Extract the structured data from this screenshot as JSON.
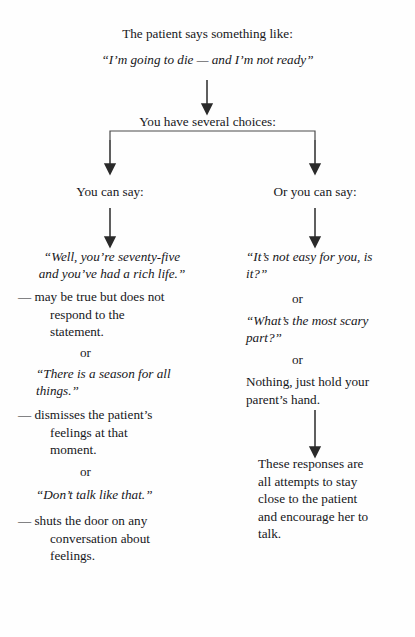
{
  "document": {
    "type": "flowchart",
    "title_line": "The patient says something like:",
    "patient_quote": "“I’m going to die — and I’m not ready”",
    "branch_prompt": "You have several choices:",
    "connector_or": "or"
  },
  "left_branch": {
    "heading": "You can say:",
    "options": [
      {
        "quote_lines": [
          "“Well, you’re seventy-five",
          "and you’ve had a rich life.”"
        ],
        "comment_first": "— may be true but does not",
        "comment_rest": [
          "respond to the",
          "statement."
        ]
      },
      {
        "quote_lines": [
          "“There is a season for all",
          "things.”"
        ],
        "comment_first": "— dismisses the patient’s",
        "comment_rest": [
          "feelings at that",
          "moment."
        ]
      },
      {
        "quote_lines": [
          "“Don’t talk like that.”"
        ],
        "comment_first": "— shuts the door on any",
        "comment_rest": [
          "conversation about",
          "feelings."
        ]
      }
    ]
  },
  "right_branch": {
    "heading": "Or you can say:",
    "options": [
      {
        "quote_lines": [
          "“It’s not easy for you, is",
          "it?”"
        ]
      },
      {
        "quote_lines": [
          "“What’s the most scary",
          "part?”"
        ]
      },
      {
        "plain_lines": [
          "Nothing, just hold your",
          "parent’s hand."
        ]
      }
    ],
    "conclusion_lines": [
      "These responses are",
      "all attempts to stay",
      "close to the patient",
      "and encourage her to",
      "talk."
    ]
  },
  "style": {
    "ink": "#16161a",
    "paper": "#fefefe",
    "rule": "#3a3a3a"
  }
}
